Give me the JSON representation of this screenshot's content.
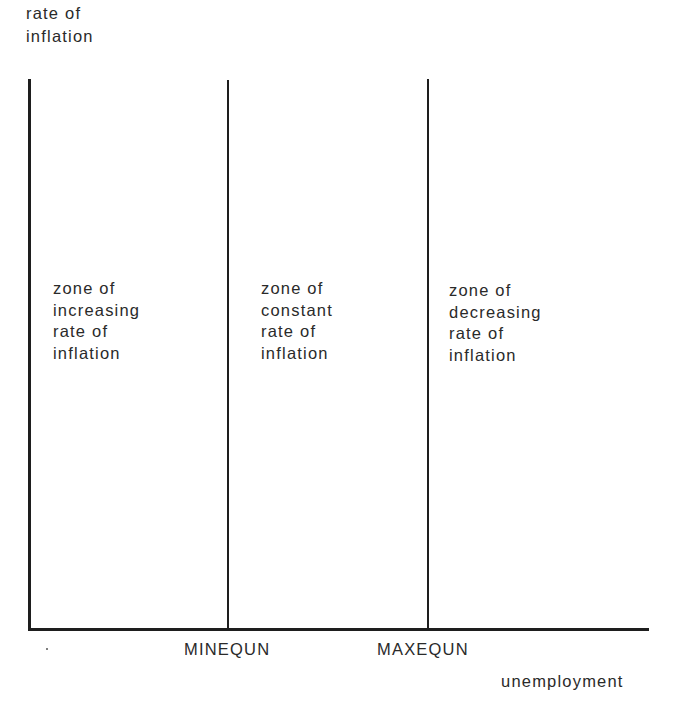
{
  "diagram": {
    "y_axis_label": [
      "rate of",
      "inflation"
    ],
    "x_axis_label": "unemployment",
    "thresholds": [
      {
        "label": "MINEQUN"
      },
      {
        "label": "MAXEQUN"
      }
    ],
    "zones": [
      {
        "lines": [
          "zone of",
          "increasing",
          "rate of",
          "inflation"
        ]
      },
      {
        "lines": [
          "zone of",
          "constant",
          "rate of",
          "inflation"
        ]
      },
      {
        "lines": [
          "zone of",
          "decreasing",
          "rate of",
          "inflation"
        ]
      }
    ],
    "line_color": "#1e1e1e",
    "text_color": "#2a2a2a"
  }
}
